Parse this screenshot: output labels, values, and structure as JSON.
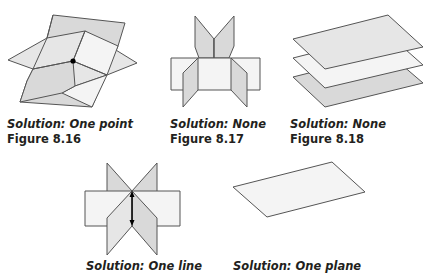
{
  "figures": [
    {
      "solution": "Solution:  One point",
      "label": "Figure 8.16",
      "depicts": "three planes intersecting in one point"
    },
    {
      "solution": "Solution:  None",
      "label": "Figure 8.17",
      "depicts": "three planes with no common intersection"
    },
    {
      "solution": "Solution:  None",
      "label": "Figure 8.18",
      "depicts": "three parallel planes"
    },
    {
      "solution": "Solution:  One line",
      "label": "",
      "depicts": "three planes intersecting in a line"
    },
    {
      "solution": "Solution:  One plane",
      "label": "",
      "depicts": "three coincident planes"
    }
  ],
  "colors": {
    "plane_dark": "#d9d9d9",
    "plane_light": "#f4f4f4",
    "edge": "#555555",
    "text": "#231f20"
  }
}
